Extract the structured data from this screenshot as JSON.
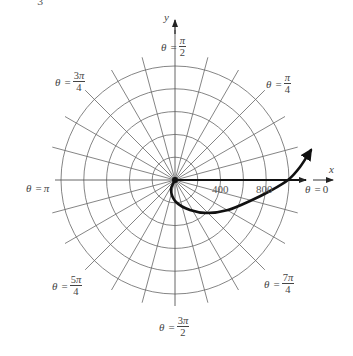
{
  "figure": {
    "type": "polar-grid-diagram",
    "center_px": [
      175,
      180
    ],
    "px_per_unit": 0.114,
    "circle_step": 200,
    "circle_count": 5,
    "radial_step_deg": 15,
    "colors": {
      "grid": "#555555",
      "curve": "#111111",
      "text": "#444444"
    }
  },
  "axes": {
    "x_label": "x",
    "y_label": "y",
    "tick_labels": [
      "400",
      "800"
    ]
  },
  "angle_labels": {
    "theta0": {
      "lhs": "θ",
      "eq": "=",
      "rhs": "0"
    },
    "pi_over_4": {
      "lhs": "θ",
      "eq": "=",
      "num": "π",
      "den": "4"
    },
    "pi_over_2": {
      "lhs": "θ",
      "eq": "=",
      "num": "π",
      "den": "2"
    },
    "three_pi_over_4": {
      "lhs": "θ",
      "eq": "=",
      "num_coef": "3",
      "num": "π",
      "den": "4"
    },
    "pi": {
      "lhs": "θ",
      "eq": "=",
      "rhs": "π"
    },
    "five_pi_over_4": {
      "lhs": "θ",
      "eq": "=",
      "num_coef": "5",
      "num": "π",
      "den": "4"
    },
    "three_pi_over_2": {
      "lhs": "θ",
      "eq": "=",
      "num_coef": "3",
      "num": "π",
      "den": "2"
    },
    "seven_pi_over_4": {
      "lhs": "θ",
      "eq": "=",
      "num_coef": "7",
      "num": "π",
      "den": "4"
    }
  },
  "curve": {
    "description": "spiral-like path from origin, dipping below x-axis, crossing x-axis near r≈1000, ending with arrowhead in first quadrant",
    "points_px": [
      [
        175,
        180
      ],
      [
        171,
        190
      ],
      [
        176,
        202
      ],
      [
        190,
        210
      ],
      [
        207,
        213
      ],
      [
        228,
        210
      ],
      [
        250,
        201
      ],
      [
        270,
        191
      ],
      [
        288,
        180
      ],
      [
        300,
        167
      ],
      [
        311,
        150
      ]
    ]
  },
  "artifact_text": "3"
}
